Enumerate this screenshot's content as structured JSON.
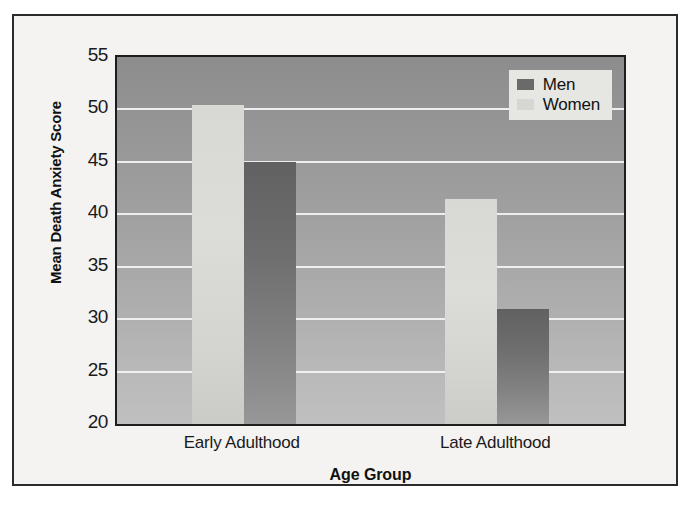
{
  "chart_data": {
    "type": "bar",
    "title": "",
    "xlabel": "Age Group",
    "ylabel": "Mean Death Anxiety Score",
    "categories": [
      "Early Adulthood",
      "Late Adulthood"
    ],
    "series": [
      {
        "name": "Men",
        "color": "#6a6a6a",
        "values": [
          45.0,
          31.0
        ]
      },
      {
        "name": "Women",
        "color": "#d6d6d2",
        "values": [
          50.4,
          41.5
        ]
      }
    ],
    "bar_order_within_group": [
      "Women",
      "Men"
    ],
    "ylim": [
      20,
      55
    ],
    "ytick_step": 5,
    "yticks": [
      55,
      50,
      45,
      40,
      35,
      30,
      25,
      20
    ],
    "ytick_labels": [
      "55",
      "50",
      "45",
      "40",
      "35",
      "30",
      "25",
      "20"
    ],
    "grid": true,
    "grid_axis": "y",
    "grid_color": "#f2f2f2",
    "legend_position": "top-right",
    "legend_entries": [
      "Men",
      "Women"
    ],
    "plot_background": "gray-vertical-gradient",
    "frame": true
  },
  "axes": {
    "y_title": "Mean Death Anxiety Score",
    "x_title": "Age Group"
  },
  "legend": {
    "items": [
      {
        "label": "Men",
        "swatch": "men"
      },
      {
        "label": "Women",
        "swatch": "women"
      }
    ]
  }
}
